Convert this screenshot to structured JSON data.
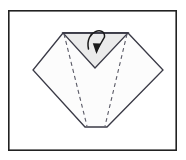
{
  "figure": {
    "kind": "origami-fold-diagram",
    "caption": "",
    "background_color": "#ffffff",
    "frame": {
      "name": "diagram-border",
      "x": 8,
      "y": 10,
      "width": 169,
      "height": 141,
      "stroke_color": "#222222",
      "stroke_width": 1.6,
      "fill_color": "#ffffff"
    },
    "colors": {
      "outline": "#3a3a46",
      "paper_front": "#fcfcfc",
      "paper_shaded": "#ebebeb",
      "fold_line": "#5a5a66",
      "arrow": "#1a1a1a"
    },
    "shapes": [
      {
        "name": "paper-body-outline",
        "type": "polygon",
        "fill": "#fcfcfc",
        "stroke": "#3a3a46",
        "stroke_width": 1.3,
        "points": "63,33 128,33 163,70 107,127 85,127 33,70"
      },
      {
        "name": "shaded-inner-triangle",
        "type": "polygon",
        "fill": "#ebebeb",
        "stroke": "#3a3a46",
        "stroke_width": 1.3,
        "points": "63,33 128,33 95,68"
      }
    ],
    "fold_lines": [
      {
        "name": "fold-crease-left",
        "type": "dashed-line",
        "x1": 64,
        "y1": 34,
        "x2": 87,
        "y2": 126,
        "dash": "4,3.2",
        "stroke": "#5a5a66",
        "stroke_width": 1.1
      },
      {
        "name": "fold-crease-right",
        "type": "dashed-line",
        "x1": 127,
        "y1": 34,
        "x2": 105,
        "y2": 126,
        "dash": "4,3.2",
        "stroke": "#5a5a66",
        "stroke_width": 1.1
      }
    ],
    "arrow": {
      "name": "fold-direction-arrow",
      "type": "curved-loop-arrow",
      "description": "loop-over-and-down",
      "path": "M 88.5,49 C 84.5,30 105.5,25.5 104.5,37 L 96.5,51",
      "stroke": "#1a1a1a",
      "stroke_width": 1.5,
      "head": {
        "name": "arrowhead",
        "points": "96.5,54 92.8,43.2 100.8,43.6",
        "fill": "#1a1a1a"
      }
    },
    "labels": []
  }
}
